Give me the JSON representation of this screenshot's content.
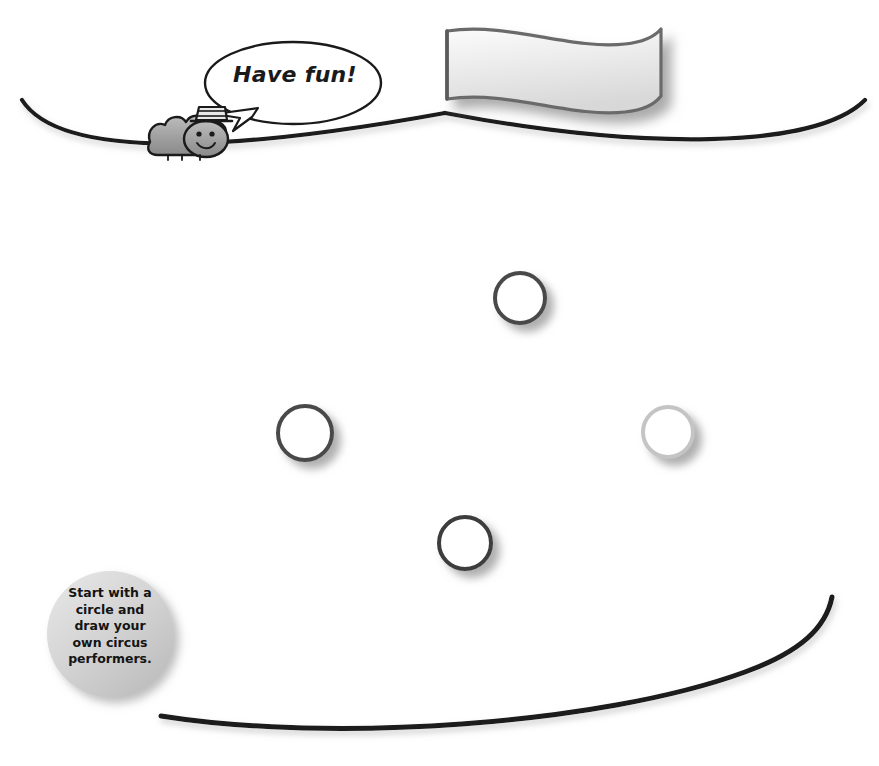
{
  "page": {
    "background_color": "#ffffff",
    "width": 879,
    "height": 766
  },
  "speech_bubble": {
    "text": "Have fun!",
    "fill_color": "#ffffff",
    "stroke_color": "#1a1a1a"
  },
  "character": {
    "name": "caterpillar-with-top-hat",
    "body_color": "#9a9a9a",
    "outline_color": "#1a1a1a",
    "hat": "striped-top-hat",
    "face": "smiley"
  },
  "banner": {
    "name": "blank-wavy-flag",
    "fill_color": "#f2f2f2",
    "stroke_color": "#6b6b6b",
    "text": ""
  },
  "tightrope": {
    "top_line_color": "#1a1a1a",
    "bottom_line_color": "#1a1a1a"
  },
  "instruction_badge": {
    "lines": [
      "Start with a",
      "circle and",
      "draw your",
      "own circus",
      "performers."
    ],
    "fill_color": "#cfcfcf",
    "text_color": "#141414"
  },
  "circles": [
    {
      "label": "top-circle",
      "cx": 520,
      "cy": 298,
      "r": 25,
      "stroke_color": "#4a4a4a"
    },
    {
      "label": "left-circle",
      "cx": 305,
      "cy": 433,
      "r": 27,
      "stroke_color": "#4a4a4a"
    },
    {
      "label": "right-circle",
      "cx": 668,
      "cy": 432,
      "r": 25,
      "stroke_color": "#c4c4c4"
    },
    {
      "label": "bottom-circle",
      "cx": 465,
      "cy": 543,
      "r": 26,
      "stroke_color": "#3c3c3c"
    }
  ]
}
